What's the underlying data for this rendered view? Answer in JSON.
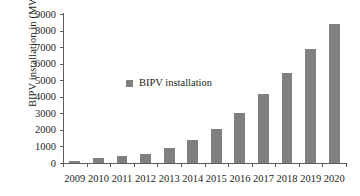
{
  "chart_data": {
    "type": "bar",
    "title": "",
    "xlabel": "",
    "ylabel": "BIPV installation in (MW)",
    "categories": [
      "2009",
      "2010",
      "2011",
      "2012",
      "2013",
      "2014",
      "2015",
      "2016",
      "2017",
      "2018",
      "2019",
      "2020"
    ],
    "values": [
      150,
      280,
      400,
      560,
      880,
      1380,
      2080,
      3050,
      4180,
      5430,
      6900,
      8400
    ],
    "series": [
      {
        "name": "BIPV installation",
        "color": "#808080",
        "values": [
          150,
          280,
          400,
          560,
          880,
          1380,
          2080,
          3050,
          4180,
          5430,
          6900,
          8400
        ]
      }
    ],
    "ylim": [
      0,
      9000
    ],
    "yticks": [
      0,
      1000,
      2000,
      3000,
      4000,
      5000,
      6000,
      7000,
      8000,
      9000
    ],
    "ytick_labels": [
      "0",
      "1000",
      "2000",
      "3000",
      "4000",
      "5000",
      "6000",
      "7000",
      "8000",
      "9000"
    ],
    "grid": false,
    "legend": {
      "position": "inside-upper-left",
      "entries": [
        {
          "label": "BIPV installation",
          "color": "#808080",
          "marker": "square"
        }
      ]
    },
    "axis_color": "#5d5d5d",
    "background": "#ffffff"
  }
}
